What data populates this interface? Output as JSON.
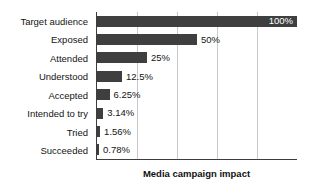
{
  "chart_data": {
    "type": "bar",
    "orientation": "horizontal",
    "title": "Media campaign impact",
    "xlabel": "",
    "ylabel": "",
    "xlim": [
      0,
      100
    ],
    "grid": true,
    "gridlines_at": [
      20,
      40,
      60,
      80
    ],
    "legend": null,
    "bar_color": "#3f3f3f",
    "axis_color": "#3d3d3d",
    "grid_color": "#c9c9c9",
    "inside_label_color": "#ffffff",
    "categories": [
      "Target audience",
      "Exposed",
      "Attended",
      "Understood",
      "Accepted",
      "Intended to try",
      "Tried",
      "Succeeded"
    ],
    "values": [
      100,
      50,
      25,
      12.5,
      6.25,
      3.14,
      1.56,
      0.78
    ],
    "data_labels": [
      "100%",
      "50%",
      "25%",
      "12.5%",
      "6.25%",
      "3.14%",
      "1.56%",
      "0.78%"
    ],
    "label_placement": [
      "inside",
      "outside",
      "outside",
      "outside",
      "outside",
      "outside",
      "outside",
      "outside"
    ]
  }
}
